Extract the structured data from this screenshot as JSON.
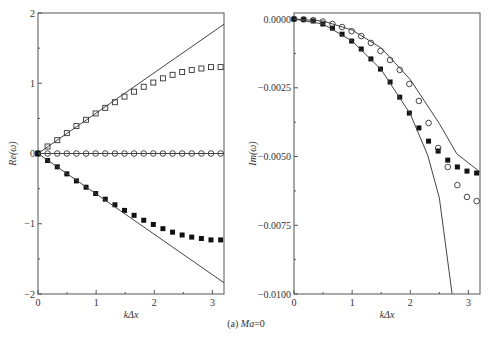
{
  "caption": {
    "prefix": "(a) ",
    "label": "Ma",
    "suffix": "=0"
  },
  "chart_data": [
    {
      "type": "scatter",
      "title": "",
      "xlabel": "kΔx",
      "ylabel": "Re(ω)",
      "xlim": [
        0,
        3.2
      ],
      "ylim": [
        -2,
        2
      ],
      "xticks": [
        0,
        1,
        2,
        3
      ],
      "yticks": [
        -2,
        -1,
        0,
        1,
        2
      ],
      "grid": false,
      "legend": null,
      "x": [
        0,
        0.165,
        0.331,
        0.496,
        0.661,
        0.827,
        0.992,
        1.157,
        1.323,
        1.488,
        1.653,
        1.819,
        1.984,
        2.149,
        2.315,
        2.48,
        2.645,
        2.811,
        2.976,
        3.142
      ],
      "series": [
        {
          "name": "open squares",
          "marker": "open-square",
          "values": [
            0,
            0.1,
            0.19,
            0.29,
            0.39,
            0.48,
            0.57,
            0.65,
            0.73,
            0.81,
            0.88,
            0.95,
            1.01,
            1.07,
            1.12,
            1.16,
            1.19,
            1.21,
            1.23,
            1.23
          ]
        },
        {
          "name": "open circles",
          "marker": "open-circle",
          "values": [
            0,
            0,
            0,
            0,
            0,
            0,
            0,
            0,
            0,
            0,
            0,
            0,
            0,
            0,
            0,
            0,
            0,
            0,
            0,
            0
          ]
        },
        {
          "name": "filled squares",
          "marker": "filled-square",
          "values": [
            0,
            -0.1,
            -0.19,
            -0.29,
            -0.39,
            -0.48,
            -0.57,
            -0.65,
            -0.73,
            -0.81,
            -0.88,
            -0.95,
            -1.01,
            -1.07,
            -1.12,
            -1.16,
            -1.19,
            -1.21,
            -1.23,
            -1.23
          ]
        },
        {
          "name": "exact upper",
          "marker": "line",
          "x": [
            0,
            3.2
          ],
          "values": [
            0,
            1.84
          ]
        },
        {
          "name": "exact zero",
          "marker": "line",
          "x": [
            0,
            3.2
          ],
          "values": [
            0,
            0
          ]
        },
        {
          "name": "exact lower",
          "marker": "line",
          "x": [
            0,
            3.2
          ],
          "values": [
            0,
            -1.84
          ]
        }
      ]
    },
    {
      "type": "scatter",
      "title": "",
      "xlabel": "kΔx",
      "ylabel": "Im(ω)",
      "xlim": [
        0,
        3.2
      ],
      "ylim": [
        -0.01,
        0.0002
      ],
      "xticks": [
        0,
        1,
        2,
        3
      ],
      "yticks": [
        0.0,
        -0.0025,
        -0.005,
        -0.0075,
        -0.01
      ],
      "ytick_labels": [
        "0.0000",
        "−0.0025",
        "−0.0050",
        "−0.0075",
        "−0.0100"
      ],
      "grid": false,
      "legend": null,
      "x": [
        0,
        0.165,
        0.331,
        0.496,
        0.661,
        0.827,
        0.992,
        1.157,
        1.323,
        1.488,
        1.653,
        1.819,
        1.984,
        2.149,
        2.315,
        2.48,
        2.645,
        2.811,
        2.976,
        3.142
      ],
      "series": [
        {
          "name": "filled squares",
          "marker": "filled-square",
          "values": [
            0,
            -2e-05,
            -7e-05,
            -0.00018,
            -0.00033,
            -0.00055,
            -0.0008,
            -0.00109,
            -0.00145,
            -0.00182,
            -0.00229,
            -0.00284,
            -0.00342,
            -0.00396,
            -0.00444,
            -0.0048,
            -0.00513,
            -0.00538,
            -0.00553,
            -0.0056
          ]
        },
        {
          "name": "open circles",
          "marker": "open-circle",
          "values": [
            0,
            -1e-05,
            -4e-05,
            -9e-05,
            -0.00018,
            -0.00029,
            -0.00044,
            -0.00062,
            -0.00087,
            -0.00116,
            -0.00149,
            -0.00185,
            -0.00236,
            -0.00298,
            -0.00378,
            -0.00469,
            -0.00538,
            -0.00604,
            -0.00647,
            -0.00662
          ]
        },
        {
          "name": "exact filled",
          "marker": "line",
          "x": [
            0,
            0.5,
            1.0,
            1.5,
            2.0,
            2.3,
            2.5,
            2.72
          ],
          "values": [
            0,
            -0.00018,
            -0.0008,
            -0.00184,
            -0.00345,
            -0.00495,
            -0.0065,
            -0.01
          ]
        },
        {
          "name": "exact open",
          "marker": "line",
          "x": [
            0,
            0.5,
            1.0,
            1.5,
            2.0,
            2.5,
            2.8,
            3.2
          ],
          "values": [
            0,
            -7e-05,
            -0.0004,
            -0.00105,
            -0.0022,
            -0.0038,
            -0.0049,
            -0.00556
          ]
        }
      ]
    }
  ]
}
